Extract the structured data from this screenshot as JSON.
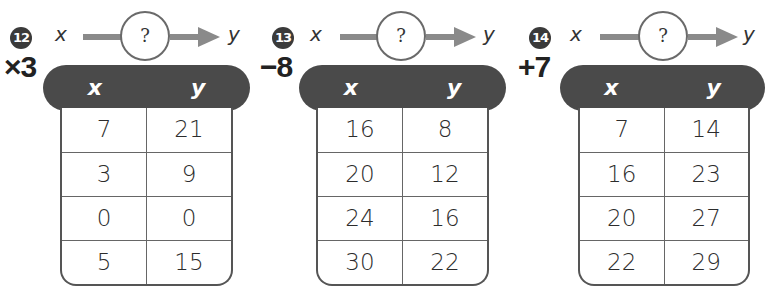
{
  "problems": [
    {
      "number": "12",
      "input_label": "x",
      "output_label": "y",
      "rule_placeholder": "?",
      "answer": "×3",
      "headers": [
        "x",
        "y"
      ],
      "rows": [
        [
          "7",
          "21"
        ],
        [
          "3",
          "9"
        ],
        [
          "0",
          "0"
        ],
        [
          "5",
          "15"
        ]
      ]
    },
    {
      "number": "13",
      "input_label": "x",
      "output_label": "y",
      "rule_placeholder": "?",
      "answer": "−8",
      "headers": [
        "x",
        "y"
      ],
      "rows": [
        [
          "16",
          "8"
        ],
        [
          "20",
          "12"
        ],
        [
          "24",
          "16"
        ],
        [
          "30",
          "22"
        ]
      ]
    },
    {
      "number": "14",
      "input_label": "x",
      "output_label": "y",
      "rule_placeholder": "?",
      "answer": "+7",
      "headers": [
        "x",
        "y"
      ],
      "rows": [
        [
          "7",
          "14"
        ],
        [
          "16",
          "23"
        ],
        [
          "20",
          "27"
        ],
        [
          "22",
          "29"
        ]
      ]
    }
  ],
  "colors": {
    "badge": "#3a3a3a",
    "header_fill": "#4a4a4a",
    "arrow": "#8a8a8a",
    "border": "#555555"
  }
}
